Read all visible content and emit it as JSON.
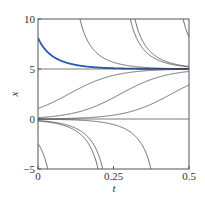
{
  "chart_data": {
    "type": "line",
    "title": "",
    "xlabel": "t",
    "ylabel": "x",
    "xlim": [
      0,
      0.5
    ],
    "ylim": [
      -5,
      10
    ],
    "xticks": [
      0,
      0.25,
      0.5
    ],
    "xtick_labels": [
      "0",
      "0.25",
      "0.5"
    ],
    "yticks": [
      -5,
      0,
      5,
      10
    ],
    "ytick_labels": [
      "−5",
      "0",
      "5",
      "10"
    ],
    "grid": false,
    "model": {
      "equation": "logistic",
      "rate": 13,
      "capacity": 5
    },
    "series": [
      {
        "name": "highlighted",
        "color": "#2a56b8",
        "anchor_t": 0,
        "anchor_x": 8.1
      },
      {
        "name": "from-above-1",
        "color": "#444444",
        "anchor_t": 0.139,
        "anchor_x": 10
      },
      {
        "name": "from-above-2",
        "color": "#444444",
        "anchor_t": 0.321,
        "anchor_x": 10
      },
      {
        "name": "equilibrium-5",
        "color": "#444444",
        "anchor_t": 0,
        "anchor_x": 5
      },
      {
        "name": "rising-1",
        "color": "#444444",
        "anchor_t": 0,
        "anchor_x": 1.05
      },
      {
        "name": "rising-2",
        "color": "#444444",
        "anchor_t": 0,
        "anchor_x": 0.14
      },
      {
        "name": "rising-3",
        "color": "#444444",
        "anchor_t": 0,
        "anchor_x": 0.016
      },
      {
        "name": "equilibrium-0",
        "color": "#444444",
        "anchor_t": 0,
        "anchor_x": 0
      },
      {
        "name": "falling-1",
        "color": "#444444",
        "anchor_t": 0.199,
        "anchor_x": -5
      },
      {
        "name": "falling-2",
        "color": "#444444",
        "anchor_t": 0.374,
        "anchor_x": -5
      }
    ]
  }
}
